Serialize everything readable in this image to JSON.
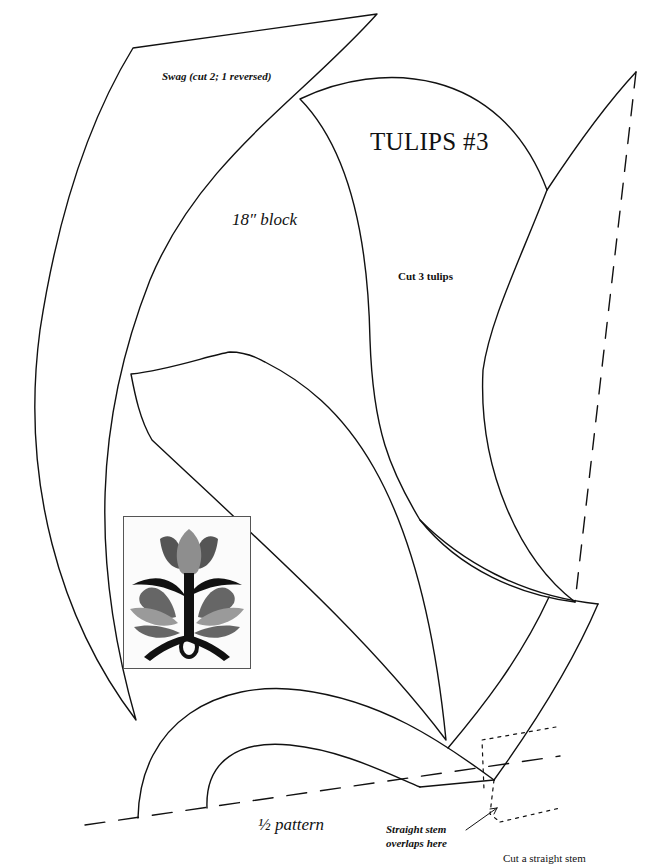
{
  "page": {
    "title": "TULIPS #3",
    "colors": {
      "line": "#111111",
      "paper": "#ffffff",
      "tulip_dark": "#555555",
      "tulip_mid": "#7a7a7a",
      "tulip_light": "#9a9a9a",
      "stem": "#111111"
    }
  },
  "labels": {
    "swag": "Swag (cut 2; 1 reversed)",
    "block_size": "18″ block",
    "cut_tulips": "Cut 3 tulips",
    "half_pattern": "½ pattern",
    "stem_overlap_line1": "Straight stem",
    "stem_overlap_line2": "overlaps here",
    "cut_stem_partial": "Cut a straight stem"
  },
  "pieces": [
    {
      "name": "swag",
      "note": "Swag (cut 2; 1 reversed)"
    },
    {
      "name": "tulip",
      "note": "Cut 3 tulips"
    },
    {
      "name": "leaf"
    },
    {
      "name": "tulip-side-petal"
    },
    {
      "name": "stem-band"
    },
    {
      "name": "loop-stem-half"
    }
  ],
  "thumbnail": {
    "name": "finished-block-preview",
    "motif": "three tulips on dark stem with loop"
  }
}
